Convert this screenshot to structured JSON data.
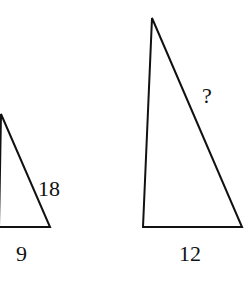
{
  "diagram": {
    "type": "similar-triangles",
    "small_triangle": {
      "hypotenuse_label": "18",
      "base_label": "9"
    },
    "large_triangle": {
      "hypotenuse_label": "?",
      "base_label": "12"
    },
    "stroke_color": "#111111",
    "background_color": "#ffffff"
  }
}
